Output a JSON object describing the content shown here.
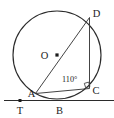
{
  "figure": {
    "background_color": "#ffffff",
    "ink_color": "#2b2b2b",
    "labels": {
      "center": "O",
      "point_a": "A",
      "point_b": "B",
      "point_c": "C",
      "point_d": "D",
      "point_t": "T",
      "angle_at_c": "110°"
    },
    "geometry": {
      "circle": {
        "cx": 57,
        "cy": 55,
        "r": 44
      },
      "points": {
        "O": {
          "x": 57,
          "y": 55
        },
        "A": {
          "x": 35.5,
          "y": 93.5
        },
        "B": {
          "x": 60,
          "y": 98.8
        },
        "C": {
          "x": 89.5,
          "y": 88.0
        },
        "D": {
          "x": 89.5,
          "y": 17.5
        },
        "T": {
          "x": 20,
          "y": 100.5
        }
      },
      "segments": [
        {
          "name": "diameter-AD",
          "from": "A",
          "to": "D"
        },
        {
          "name": "chord-DC",
          "from": "D",
          "to": "C"
        },
        {
          "name": "chord-AC",
          "from": "A",
          "to": "C"
        },
        {
          "name": "tangent-line",
          "from": "T",
          "to": "right-edge"
        }
      ],
      "tangent_y": 100.5,
      "right_angle_at": "C"
    }
  }
}
